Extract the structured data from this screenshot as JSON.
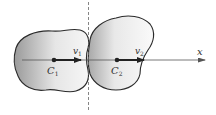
{
  "diagram": {
    "title": "",
    "axis": {
      "label": "x"
    },
    "bodies": [
      {
        "center_label": "C",
        "center_sub": "1",
        "velocity_label": "v",
        "velocity_sub": "1"
      },
      {
        "center_label": "C",
        "center_sub": "2",
        "velocity_label": "v",
        "velocity_sub": "2"
      }
    ],
    "colors": {
      "outline": "#2a2a2a",
      "shade_dark": "#9a9a9a",
      "shade_light": "#f4f4f4",
      "axis": "#555555",
      "dashed_line": "#666666"
    }
  }
}
